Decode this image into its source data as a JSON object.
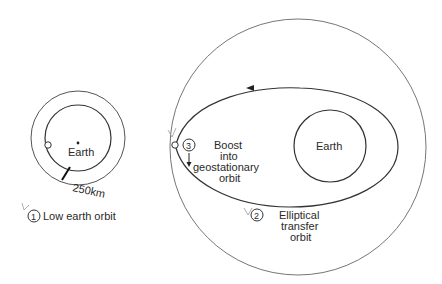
{
  "diagram": {
    "stages": [
      {
        "number": "1",
        "label": "Low earth orbit"
      },
      {
        "number": "2",
        "label_lines": [
          "Elliptical",
          "transfer",
          "orbit"
        ]
      },
      {
        "number": "3",
        "label_lines": [
          "Boost",
          "into",
          "geostationary",
          "orbit"
        ]
      }
    ],
    "left_earth_label": "Earth",
    "right_earth_label": "Earth",
    "altitude_label": "250km",
    "colors": {
      "line": "#444444",
      "text": "#2a2a2a",
      "background": "#ffffff"
    }
  }
}
